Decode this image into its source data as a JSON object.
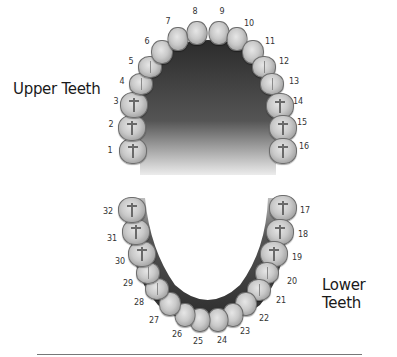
{
  "labels": {
    "upper": "Upper Teeth",
    "lower": "Lower Teeth"
  },
  "colors": {
    "palate_dark": "#2a2a2a",
    "palate_light": "#d8d8d8",
    "tooth_light": "#e6e6e6",
    "tooth_dark": "#7d7d7d",
    "text": "#1a1a1a"
  },
  "upper_teeth": [
    {
      "n": "1",
      "type": "molar",
      "tx": 133,
      "ty": 151,
      "lx": 110,
      "ly": 150
    },
    {
      "n": "2",
      "type": "molar",
      "tx": 132,
      "ty": 128,
      "lx": 111,
      "ly": 124
    },
    {
      "n": "3",
      "type": "molar",
      "tx": 134,
      "ty": 105,
      "lx": 116,
      "ly": 101
    },
    {
      "n": "4",
      "type": "premolar",
      "tx": 141,
      "ty": 84,
      "lx": 122,
      "ly": 81
    },
    {
      "n": "5",
      "type": "premolar",
      "tx": 150,
      "ty": 67,
      "lx": 131,
      "ly": 61
    },
    {
      "n": "6",
      "type": "canine",
      "tx": 162,
      "ty": 52,
      "lx": 147,
      "ly": 41
    },
    {
      "n": "7",
      "type": "incisor",
      "tx": 178,
      "ty": 39,
      "lx": 168,
      "ly": 21
    },
    {
      "n": "8",
      "type": "incisor",
      "tx": 197,
      "ty": 33,
      "lx": 195,
      "ly": 11
    },
    {
      "n": "9",
      "type": "incisor",
      "tx": 219,
      "ty": 33,
      "lx": 222,
      "ly": 11
    },
    {
      "n": "10",
      "type": "incisor",
      "tx": 237,
      "ty": 39,
      "lx": 249,
      "ly": 23
    },
    {
      "n": "11",
      "type": "canine",
      "tx": 253,
      "ty": 52,
      "lx": 270,
      "ly": 41
    },
    {
      "n": "12",
      "type": "premolar",
      "tx": 264,
      "ty": 67,
      "lx": 284,
      "ly": 61
    },
    {
      "n": "13",
      "type": "premolar",
      "tx": 272,
      "ty": 84,
      "lx": 294,
      "ly": 81
    },
    {
      "n": "14",
      "type": "molar",
      "tx": 280,
      "ty": 106,
      "lx": 298,
      "ly": 101
    },
    {
      "n": "15",
      "type": "molar",
      "tx": 283,
      "ty": 128,
      "lx": 302,
      "ly": 122
    },
    {
      "n": "16",
      "type": "molar",
      "tx": 283,
      "ty": 151,
      "lx": 304,
      "ly": 146
    }
  ],
  "lower_teeth": [
    {
      "n": "17",
      "type": "molar",
      "tx": 283,
      "ty": 208,
      "lx": 305,
      "ly": 210
    },
    {
      "n": "18",
      "type": "molar",
      "tx": 280,
      "ty": 232,
      "lx": 303,
      "ly": 234
    },
    {
      "n": "19",
      "type": "molar",
      "tx": 274,
      "ty": 254,
      "lx": 297,
      "ly": 257
    },
    {
      "n": "20",
      "type": "premolar",
      "tx": 267,
      "ty": 273,
      "lx": 292,
      "ly": 281
    },
    {
      "n": "21",
      "type": "premolar",
      "tx": 259,
      "ty": 290,
      "lx": 281,
      "ly": 300
    },
    {
      "n": "22",
      "type": "canine",
      "tx": 246,
      "ty": 304,
      "lx": 264,
      "ly": 318
    },
    {
      "n": "23",
      "type": "incisor",
      "tx": 233,
      "ty": 315,
      "lx": 245,
      "ly": 331
    },
    {
      "n": "24",
      "type": "incisor",
      "tx": 218,
      "ty": 320,
      "lx": 222,
      "ly": 340
    },
    {
      "n": "25",
      "type": "incisor",
      "tx": 200,
      "ty": 320,
      "lx": 198,
      "ly": 341
    },
    {
      "n": "26",
      "type": "incisor",
      "tx": 185,
      "ty": 315,
      "lx": 177,
      "ly": 334
    },
    {
      "n": "27",
      "type": "canine",
      "tx": 170,
      "ty": 304,
      "lx": 154,
      "ly": 320
    },
    {
      "n": "28",
      "type": "premolar",
      "tx": 157,
      "ty": 289,
      "lx": 139,
      "ly": 302
    },
    {
      "n": "29",
      "type": "premolar",
      "tx": 148,
      "ty": 273,
      "lx": 128,
      "ly": 283
    },
    {
      "n": "30",
      "type": "molar",
      "tx": 142,
      "ty": 254,
      "lx": 120,
      "ly": 261
    },
    {
      "n": "31",
      "type": "molar",
      "tx": 136,
      "ty": 232,
      "lx": 112,
      "ly": 238
    },
    {
      "n": "32",
      "type": "molar",
      "tx": 132,
      "ty": 210,
      "lx": 108,
      "ly": 211
    }
  ]
}
